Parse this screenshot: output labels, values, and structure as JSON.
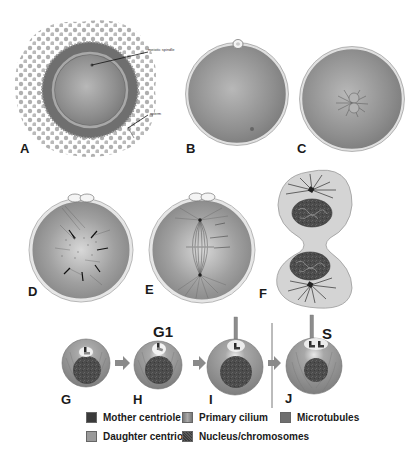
{
  "figure": {
    "panels": [
      {
        "id": "A",
        "letter": "A",
        "description": "Oocyte surrounded by cumulus cells with sperm approaching",
        "callouts": [
          "meiotic spindle",
          "sperm"
        ]
      },
      {
        "id": "B",
        "letter": "B",
        "description": "Fertilized egg with polar body"
      },
      {
        "id": "C",
        "letter": "C",
        "description": "Egg with pronuclei and aster"
      },
      {
        "id": "D",
        "letter": "D",
        "description": "Zygote with dispersed microtubule network (arrows)"
      },
      {
        "id": "E",
        "letter": "E",
        "description": "Zygote with bipolar mitotic spindle"
      },
      {
        "id": "F",
        "letter": "F",
        "description": "Dividing cell (two daughter cells) with nuclei and centrosomes"
      },
      {
        "id": "G",
        "letter": "G",
        "description": "Cell with mother and daughter centriole"
      },
      {
        "id": "H",
        "letter": "H",
        "description": "Centriole migrating toward cell surface"
      },
      {
        "id": "I",
        "letter": "I",
        "description": "Primary cilium extended from mother centriole"
      },
      {
        "id": "J",
        "letter": "J",
        "description": "Centriole duplication with primary cilium"
      }
    ],
    "phases": [
      {
        "label": "G1"
      },
      {
        "label": "S"
      }
    ]
  },
  "legend": {
    "items": [
      {
        "label": "Mother centriole",
        "color": "#3a3a3a"
      },
      {
        "label": "Primary cilium",
        "color": "#8c8c8c"
      },
      {
        "label": "Microtubules",
        "color": "#6e6e6e"
      },
      {
        "label": "Daughter centriole",
        "color": "#9a9a9a"
      },
      {
        "label": "Nucleus/chromosomes",
        "color": "#4a4a4a"
      }
    ]
  },
  "colors": {
    "cell_fill": "#8e8e8e",
    "cell_light": "#c8c8c8",
    "cumulus": "#a8a8a8",
    "zona": "#6a6a6a",
    "membrane": "#e6e6e6",
    "ink": "#1a1a1a"
  }
}
